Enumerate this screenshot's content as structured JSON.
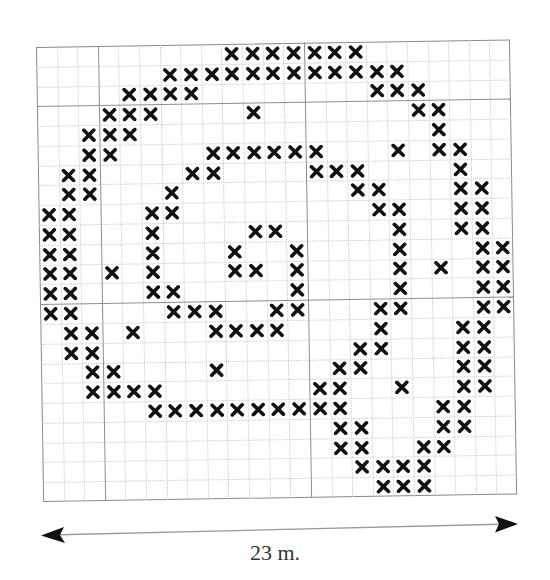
{
  "diagram": {
    "grid": {
      "columns": 23,
      "rows": 23,
      "major_lines_columns": [
        3,
        13
      ],
      "major_lines_rows": [
        3,
        13
      ],
      "mark_symbol": "x-mark",
      "mark_color": "#111111",
      "marked_cells_by_row": [
        [
          9,
          10,
          11,
          12,
          13,
          14,
          15
        ],
        [
          6,
          7,
          8,
          9,
          10,
          11,
          12,
          13,
          14,
          15,
          16,
          17
        ],
        [
          4,
          5,
          6,
          7,
          16,
          17,
          18
        ],
        [
          3,
          4,
          5,
          10,
          18,
          19
        ],
        [
          2,
          3,
          4,
          19
        ],
        [
          2,
          3,
          8,
          9,
          10,
          11,
          12,
          13,
          17,
          19,
          20
        ],
        [
          1,
          2,
          7,
          8,
          13,
          14,
          15,
          20
        ],
        [
          1,
          2,
          6,
          15,
          16,
          20,
          21
        ],
        [
          0,
          1,
          5,
          6,
          16,
          17,
          20,
          21
        ],
        [
          0,
          1,
          5,
          10,
          11,
          17,
          20,
          21
        ],
        [
          0,
          1,
          5,
          9,
          12,
          17,
          21,
          22
        ],
        [
          0,
          1,
          3,
          5,
          9,
          10,
          12,
          17,
          19,
          21,
          22
        ],
        [
          0,
          1,
          5,
          6,
          12,
          17,
          21,
          22
        ],
        [
          0,
          1,
          6,
          7,
          8,
          11,
          12,
          16,
          17,
          21,
          22
        ],
        [
          1,
          2,
          4,
          8,
          9,
          10,
          11,
          16,
          20,
          21
        ],
        [
          1,
          2,
          15,
          16,
          20,
          21
        ],
        [
          2,
          3,
          8,
          14,
          15,
          20,
          21
        ],
        [
          2,
          3,
          4,
          5,
          13,
          14,
          17,
          20,
          21
        ],
        [
          5,
          6,
          7,
          8,
          9,
          10,
          11,
          12,
          13,
          14,
          19,
          20
        ],
        [
          14,
          15,
          19,
          20
        ],
        [
          14,
          15,
          18,
          19
        ],
        [
          15,
          16,
          17,
          18
        ],
        [
          16,
          17,
          18
        ]
      ]
    },
    "dimension": {
      "label": "23 m.",
      "arrow": "double-headed-arrow"
    }
  }
}
